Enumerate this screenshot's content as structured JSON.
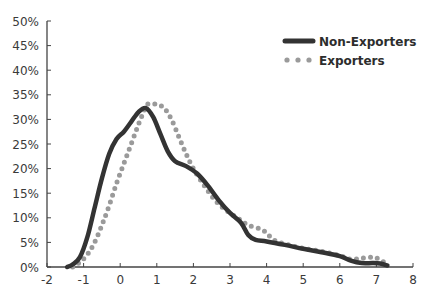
{
  "chart_data": {
    "type": "line",
    "title": "",
    "xlabel": "",
    "ylabel": "",
    "xlim": [
      -2,
      8
    ],
    "ylim": [
      0,
      50
    ],
    "grid": false,
    "legend_position": "upper right",
    "x_ticks": [
      "-2",
      "-1",
      "0",
      "1",
      "2",
      "3",
      "4",
      "5",
      "6",
      "7",
      "8"
    ],
    "y_ticks": [
      "0%",
      "5%",
      "10%",
      "15%",
      "20%",
      "25%",
      "30%",
      "35%",
      "40%",
      "45%",
      "50%"
    ],
    "series": [
      {
        "name": "Non-Exporters",
        "style": "solid-thick",
        "color": "#333333",
        "points": [
          [
            -1.45,
            0
          ],
          [
            -1.3,
            0.5
          ],
          [
            -1.1,
            2
          ],
          [
            -0.9,
            6
          ],
          [
            -0.7,
            12
          ],
          [
            -0.5,
            18
          ],
          [
            -0.3,
            23
          ],
          [
            -0.1,
            26
          ],
          [
            0.1,
            27.5
          ],
          [
            0.3,
            29.5
          ],
          [
            0.5,
            31.5
          ],
          [
            0.7,
            32.3
          ],
          [
            0.9,
            30.5
          ],
          [
            1.1,
            27
          ],
          [
            1.3,
            23.5
          ],
          [
            1.5,
            21.5
          ],
          [
            1.8,
            20.5
          ],
          [
            2.1,
            19
          ],
          [
            2.4,
            16.5
          ],
          [
            2.7,
            13.5
          ],
          [
            3.0,
            11
          ],
          [
            3.3,
            9
          ],
          [
            3.5,
            6.5
          ],
          [
            3.7,
            5.5
          ],
          [
            4.0,
            5.2
          ],
          [
            4.5,
            4.5
          ],
          [
            5.0,
            3.7
          ],
          [
            5.5,
            3.0
          ],
          [
            6.0,
            2.2
          ],
          [
            6.3,
            1.3
          ],
          [
            6.6,
            0.8
          ],
          [
            6.9,
            0.8
          ],
          [
            7.1,
            0.7
          ],
          [
            7.3,
            0.3
          ]
        ]
      },
      {
        "name": "Exporters",
        "style": "dotted",
        "color": "#9a9a9a",
        "points": [
          [
            -1.3,
            0
          ],
          [
            -1.1,
            1
          ],
          [
            -0.9,
            2.5
          ],
          [
            -0.7,
            5
          ],
          [
            -0.5,
            8.5
          ],
          [
            -0.3,
            12.5
          ],
          [
            -0.1,
            17
          ],
          [
            0.1,
            21
          ],
          [
            0.3,
            25
          ],
          [
            0.5,
            29
          ],
          [
            0.7,
            32.5
          ],
          [
            0.8,
            33.2
          ],
          [
            1.0,
            33
          ],
          [
            1.2,
            32.3
          ],
          [
            1.4,
            30
          ],
          [
            1.6,
            26.5
          ],
          [
            1.8,
            23
          ],
          [
            2.0,
            20
          ],
          [
            2.3,
            16.5
          ],
          [
            2.6,
            13.5
          ],
          [
            2.9,
            11.5
          ],
          [
            3.2,
            10
          ],
          [
            3.5,
            8.5
          ],
          [
            3.9,
            7.5
          ],
          [
            4.2,
            5.5
          ],
          [
            4.6,
            4.5
          ],
          [
            5.0,
            3.8
          ],
          [
            5.5,
            3.2
          ],
          [
            6.0,
            2.3
          ],
          [
            6.3,
            1.6
          ],
          [
            6.6,
            1.8
          ],
          [
            6.9,
            2.0
          ],
          [
            7.1,
            1.5
          ],
          [
            7.3,
            0.5
          ]
        ]
      }
    ]
  },
  "legend": {
    "items": [
      {
        "label": "Non-Exporters"
      },
      {
        "label": "Exporters"
      }
    ]
  },
  "axes": {
    "x_labels": [
      "-2",
      "-1",
      "0",
      "1",
      "2",
      "3",
      "4",
      "5",
      "6",
      "7",
      "8"
    ],
    "y_labels": [
      "0%",
      "5%",
      "10%",
      "15%",
      "20%",
      "25%",
      "30%",
      "35%",
      "40%",
      "45%",
      "50%"
    ]
  }
}
